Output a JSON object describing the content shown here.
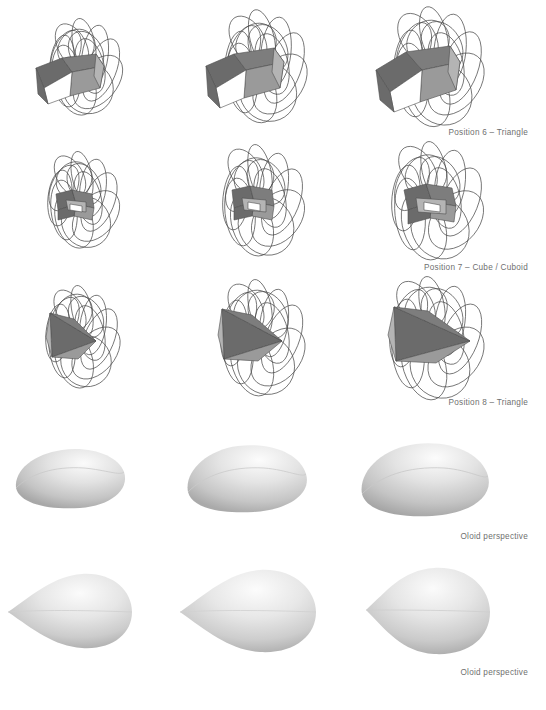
{
  "page": {
    "background": "#ffffff",
    "width": 546,
    "height": 710,
    "caption_color": "#6f6f6f",
    "wire_color": "#4a4a4a",
    "solid_dark": "#6b6b6b",
    "solid_light": "#d8d8d8"
  },
  "rows": [
    {
      "id": "row-position-6",
      "kind": "wireframe-ellipse-bundle-with-polyhedron",
      "caption": "Position 6 – Triangle",
      "views": [
        "left view",
        "center view",
        "right view"
      ]
    },
    {
      "id": "row-position-7",
      "kind": "wireframe-ellipse-bundle-with-polyhedron",
      "caption": "Position 7 – Cube / Cuboid",
      "views": [
        "left view",
        "center view",
        "right view"
      ]
    },
    {
      "id": "row-position-8",
      "kind": "wireframe-ellipse-bundle-with-polyhedron",
      "caption": "Position 8 – Triangle",
      "views": [
        "left view",
        "center view",
        "right view"
      ]
    },
    {
      "id": "row-oloid-a",
      "kind": "shaded-oloid-solid",
      "caption": "Oloid perspective",
      "views": [
        "left view",
        "center view",
        "right view"
      ]
    },
    {
      "id": "row-oloid-b",
      "kind": "shaded-teardrop-solid",
      "caption": "Oloid perspective",
      "views": [
        "left view",
        "center view",
        "right view"
      ]
    }
  ],
  "captions": {
    "c1": "Position 6 – Triangle",
    "c2": "Position 7 – Cube / Cuboid",
    "c3": "Position 8 – Triangle",
    "c4": "Oloid perspective",
    "c5": "Oloid perspective"
  }
}
